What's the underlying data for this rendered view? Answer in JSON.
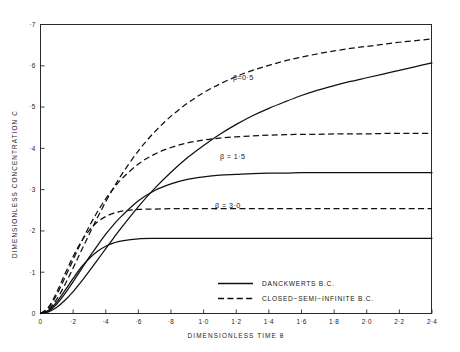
{
  "chart_data": {
    "type": "line",
    "title": "",
    "xlabel": "DIMENSIONLESS TIME θ",
    "ylabel": "DIMENSIONLESS CONCENTRATION C",
    "xlim": [
      0,
      2.4
    ],
    "ylim": [
      0,
      0.7
    ],
    "grid": false,
    "legend_position": "bottom-right",
    "xticks": [
      0,
      0.2,
      0.4,
      0.6,
      0.8,
      1.0,
      1.2,
      1.4,
      1.6,
      1.8,
      2.0,
      2.2,
      2.4
    ],
    "xtick_labels": [
      "0",
      "·2",
      "·4",
      "·6",
      "·8",
      "1·0",
      "1·2",
      "1·4",
      "1·6",
      "1·8",
      "2·0",
      "2·2",
      "2·4"
    ],
    "yticks": [
      0,
      0.1,
      0.2,
      0.3,
      0.4,
      0.5,
      0.6,
      0.7
    ],
    "ytick_labels": [
      "0",
      "·1",
      "·2",
      "·3",
      "·4",
      "·5",
      "·6",
      "·7"
    ],
    "annotations": [
      {
        "text": "β=0·5",
        "x": 1.18,
        "y": 0.565
      },
      {
        "text": "β = 1·5",
        "x": 1.1,
        "y": 0.375
      },
      {
        "text": "β = 3·0",
        "x": 1.07,
        "y": 0.255
      }
    ],
    "legend": [
      {
        "label": "DANCKWERTS B.C.",
        "style": "solid"
      },
      {
        "label": "CLOSED−SEMI−INFINITE B.C.",
        "style": "dashed"
      }
    ],
    "x": [
      0,
      0.05,
      0.1,
      0.15,
      0.2,
      0.25,
      0.3,
      0.35,
      0.4,
      0.45,
      0.5,
      0.6,
      0.7,
      0.8,
      0.9,
      1.0,
      1.1,
      1.2,
      1.3,
      1.4,
      1.5,
      1.6,
      1.7,
      1.8,
      1.9,
      2.0,
      2.1,
      2.2,
      2.3,
      2.4
    ],
    "series": [
      {
        "name": "β=0·5 Danckwerts B.C.",
        "beta": 0.5,
        "style": "solid",
        "values": [
          0,
          0.004,
          0.015,
          0.032,
          0.053,
          0.077,
          0.103,
          0.13,
          0.157,
          0.184,
          0.21,
          0.259,
          0.303,
          0.342,
          0.377,
          0.407,
          0.434,
          0.458,
          0.479,
          0.497,
          0.513,
          0.528,
          0.541,
          0.552,
          0.562,
          0.571,
          0.58,
          0.589,
          0.598,
          0.607
        ]
      },
      {
        "name": "β=0·5 Closed-semi-infinite B.C.",
        "beta": 0.5,
        "style": "dashed",
        "values": [
          0,
          0.01,
          0.035,
          0.07,
          0.11,
          0.152,
          0.193,
          0.233,
          0.271,
          0.306,
          0.338,
          0.394,
          0.44,
          0.478,
          0.509,
          0.535,
          0.556,
          0.574,
          0.589,
          0.601,
          0.612,
          0.621,
          0.629,
          0.636,
          0.642,
          0.647,
          0.652,
          0.657,
          0.661,
          0.665
        ]
      },
      {
        "name": "β=1·5 Danckwerts B.C.",
        "beta": 1.5,
        "style": "solid",
        "values": [
          0,
          0.006,
          0.023,
          0.048,
          0.077,
          0.107,
          0.137,
          0.165,
          0.192,
          0.216,
          0.237,
          0.273,
          0.298,
          0.314,
          0.325,
          0.331,
          0.335,
          0.337,
          0.339,
          0.34,
          0.34,
          0.341,
          0.341,
          0.341,
          0.341,
          0.341,
          0.341,
          0.341,
          0.341,
          0.341
        ]
      },
      {
        "name": "β=1·5 Closed-semi-infinite B.C.",
        "beta": 1.5,
        "style": "dashed",
        "values": [
          0,
          0.014,
          0.046,
          0.087,
          0.13,
          0.173,
          0.212,
          0.247,
          0.278,
          0.304,
          0.327,
          0.362,
          0.386,
          0.402,
          0.413,
          0.42,
          0.425,
          0.428,
          0.43,
          0.432,
          0.433,
          0.434,
          0.434,
          0.435,
          0.435,
          0.435,
          0.436,
          0.436,
          0.436,
          0.436
        ]
      },
      {
        "name": "β=3·0 Danckwerts B.C.",
        "beta": 3.0,
        "style": "solid",
        "values": [
          0,
          0.008,
          0.028,
          0.056,
          0.085,
          0.112,
          0.134,
          0.151,
          0.163,
          0.171,
          0.176,
          0.181,
          0.182,
          0.182,
          0.182,
          0.182,
          0.182,
          0.182,
          0.182,
          0.182,
          0.182,
          0.182,
          0.182,
          0.182,
          0.182,
          0.182,
          0.182,
          0.182,
          0.182,
          0.182
        ]
      },
      {
        "name": "β=3·0 Closed-semi-infinite B.C.",
        "beta": 3.0,
        "style": "dashed",
        "values": [
          0,
          0.016,
          0.052,
          0.096,
          0.138,
          0.174,
          0.202,
          0.222,
          0.235,
          0.243,
          0.248,
          0.252,
          0.253,
          0.254,
          0.254,
          0.254,
          0.254,
          0.254,
          0.254,
          0.254,
          0.254,
          0.254,
          0.254,
          0.254,
          0.254,
          0.254,
          0.254,
          0.254,
          0.254,
          0.254
        ]
      }
    ]
  }
}
